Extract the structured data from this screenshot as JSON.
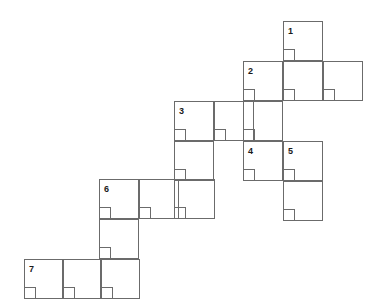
{
  "page": {
    "background_color": "#ffffff",
    "line_color": "#6b6b6b",
    "label_color": "#1a1a1a",
    "width": 379,
    "height": 308,
    "cell_size": 40,
    "notch_size": 12
  },
  "cells": [
    {
      "name": "cell-r0c7",
      "x": 283,
      "y": 21,
      "w": 40,
      "h": 40,
      "notch": true
    },
    {
      "name": "cell-r1c6",
      "x": 243,
      "y": 61,
      "w": 40,
      "h": 40,
      "notch": true
    },
    {
      "name": "cell-r1c7",
      "x": 283,
      "y": 61,
      "w": 40,
      "h": 40,
      "notch": true
    },
    {
      "name": "cell-r1c8",
      "x": 323,
      "y": 61,
      "w": 40,
      "h": 40,
      "notch": true
    },
    {
      "name": "cell-r2c4",
      "x": 174,
      "y": 101,
      "w": 40,
      "h": 40,
      "notch": true
    },
    {
      "name": "cell-r2c5",
      "x": 214,
      "y": 101,
      "w": 40,
      "h": 40,
      "notch": true
    },
    {
      "name": "cell-r2c6",
      "x": 243,
      "y": 101,
      "w": 40,
      "h": 40,
      "notch": true
    },
    {
      "name": "cell-r3c4",
      "x": 174,
      "y": 141,
      "w": 40,
      "h": 40,
      "notch": true
    },
    {
      "name": "cell-r3c6",
      "x": 243,
      "y": 141,
      "w": 40,
      "h": 40,
      "notch": true
    },
    {
      "name": "cell-r3c7",
      "x": 283,
      "y": 141,
      "w": 40,
      "h": 40,
      "notch": true
    },
    {
      "name": "cell-r4c2",
      "x": 99,
      "y": 179,
      "w": 40,
      "h": 40,
      "notch": true
    },
    {
      "name": "cell-r4c3",
      "x": 139,
      "y": 179,
      "w": 40,
      "h": 40,
      "notch": true
    },
    {
      "name": "cell-r4c4",
      "x": 174,
      "y": 179,
      "w": 41,
      "h": 40,
      "notch": true
    },
    {
      "name": "cell-r4c7",
      "x": 283,
      "y": 181,
      "w": 40,
      "h": 40,
      "notch": true
    },
    {
      "name": "cell-r5c2",
      "x": 99,
      "y": 219,
      "w": 40,
      "h": 40,
      "notch": true
    },
    {
      "name": "cell-r6c0",
      "x": 24,
      "y": 259,
      "w": 39,
      "h": 40,
      "notch": true
    },
    {
      "name": "cell-r6c1",
      "x": 63,
      "y": 259,
      "w": 38,
      "h": 40,
      "notch": true
    },
    {
      "name": "cell-r6c2",
      "x": 101,
      "y": 259,
      "w": 39,
      "h": 40,
      "notch": true
    }
  ],
  "labels": [
    {
      "name": "clue-number-1",
      "text": "1",
      "x": 288,
      "y": 27
    },
    {
      "name": "clue-number-2",
      "text": "2",
      "x": 248,
      "y": 67
    },
    {
      "name": "clue-number-3",
      "text": "3",
      "x": 179,
      "y": 107
    },
    {
      "name": "clue-number-4",
      "text": "4",
      "x": 248,
      "y": 147
    },
    {
      "name": "clue-number-5",
      "text": "5",
      "x": 288,
      "y": 147
    },
    {
      "name": "clue-number-6",
      "text": "6",
      "x": 104,
      "y": 185
    },
    {
      "name": "clue-number-7",
      "text": "7",
      "x": 29,
      "y": 265
    }
  ]
}
